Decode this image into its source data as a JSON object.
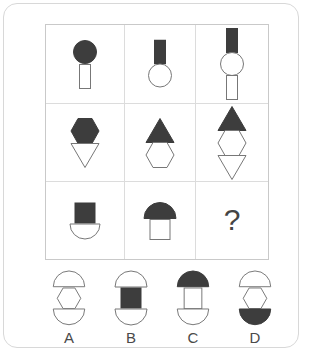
{
  "puzzle": {
    "type": "visual-analogy-matrix",
    "question_mark": "?",
    "colors": {
      "fill_dark": "#3d3d3d",
      "stroke": "#6e6e6e",
      "grid_line": "#dcdcdc",
      "border": "#c9c9c9",
      "page_border": "#d8d8d8"
    },
    "matrix": {
      "rows": 3,
      "cols": 3,
      "cells": [
        {
          "id": "cell-r1c1",
          "parts": [
            {
              "shape": "circle",
              "fill": "dark"
            },
            {
              "shape": "rect",
              "fill": "white"
            }
          ]
        },
        {
          "id": "cell-r1c2",
          "parts": [
            {
              "shape": "rect",
              "fill": "dark"
            },
            {
              "shape": "circle",
              "fill": "white"
            }
          ]
        },
        {
          "id": "cell-r1c3",
          "parts": [
            {
              "shape": "rect",
              "fill": "dark"
            },
            {
              "shape": "circle",
              "fill": "white"
            },
            {
              "shape": "rect",
              "fill": "white"
            }
          ]
        },
        {
          "id": "cell-r2c1",
          "parts": [
            {
              "shape": "hexagon",
              "fill": "dark"
            },
            {
              "shape": "triangle-down",
              "fill": "white"
            }
          ]
        },
        {
          "id": "cell-r2c2",
          "parts": [
            {
              "shape": "triangle-up",
              "fill": "dark"
            },
            {
              "shape": "hexagon",
              "fill": "white"
            }
          ]
        },
        {
          "id": "cell-r2c3",
          "parts": [
            {
              "shape": "triangle-up",
              "fill": "dark"
            },
            {
              "shape": "hexagon",
              "fill": "white"
            },
            {
              "shape": "triangle-down",
              "fill": "white"
            }
          ]
        },
        {
          "id": "cell-r3c1",
          "parts": [
            {
              "shape": "square",
              "fill": "dark"
            },
            {
              "shape": "bowl",
              "fill": "white"
            }
          ]
        },
        {
          "id": "cell-r3c2",
          "parts": [
            {
              "shape": "dome",
              "fill": "dark"
            },
            {
              "shape": "square",
              "fill": "white"
            }
          ]
        },
        {
          "id": "cell-r3c3",
          "parts": [],
          "missing": true
        }
      ]
    },
    "options": [
      {
        "letter": "A",
        "parts": [
          {
            "shape": "dome",
            "fill": "white"
          },
          {
            "shape": "hexagon",
            "fill": "white"
          },
          {
            "shape": "bowl",
            "fill": "white"
          }
        ]
      },
      {
        "letter": "B",
        "parts": [
          {
            "shape": "dome",
            "fill": "white"
          },
          {
            "shape": "square",
            "fill": "dark"
          },
          {
            "shape": "bowl",
            "fill": "white"
          }
        ]
      },
      {
        "letter": "C",
        "parts": [
          {
            "shape": "dome",
            "fill": "dark"
          },
          {
            "shape": "rect",
            "fill": "white"
          },
          {
            "shape": "bowl",
            "fill": "white"
          }
        ]
      },
      {
        "letter": "D",
        "parts": [
          {
            "shape": "dome",
            "fill": "white"
          },
          {
            "shape": "hexagon",
            "fill": "white"
          },
          {
            "shape": "bowl",
            "fill": "dark"
          }
        ]
      }
    ]
  }
}
